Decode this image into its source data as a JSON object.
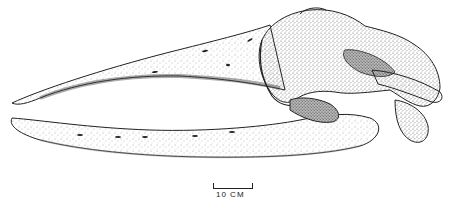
{
  "figure": {
    "parts": [
      "rostrum",
      "mandible",
      "braincase",
      "zygomatic-process",
      "occipital-condyle"
    ],
    "colors": {
      "ink": "#222222",
      "background": "#ffffff",
      "stipple": "#555555"
    }
  },
  "scale_bar": {
    "label": "10 CM"
  }
}
